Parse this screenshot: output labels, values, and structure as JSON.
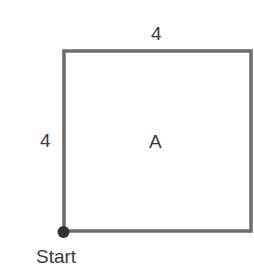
{
  "diagram": {
    "type": "square-path",
    "shape": {
      "name": "A",
      "top_side_label": "4",
      "left_side_label": "4"
    },
    "start_point": {
      "label": "Start"
    },
    "colors": {
      "stroke": "#6b6b6b",
      "dot": "#333333",
      "text": "#3a3a3a"
    }
  }
}
